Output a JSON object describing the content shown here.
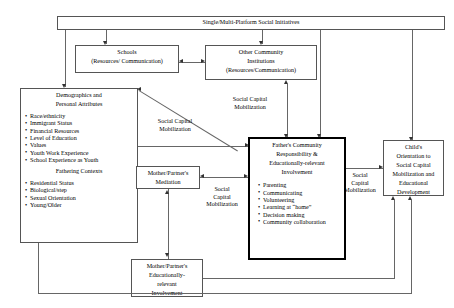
{
  "figure": {
    "type": "conceptual-flow-diagram",
    "title_box": {
      "label": "Single/Multi-Platform Social Initiatives"
    },
    "boxes": [
      {
        "id": "schools",
        "lines": [
          "Schools",
          "(Resources/ Communication)"
        ]
      },
      {
        "id": "other_community",
        "lines": [
          "Other Community",
          "Institutions",
          "(Resources/Communication)"
        ]
      },
      {
        "id": "demographics",
        "heading": [
          "Demographics and",
          "Personal Attributes"
        ],
        "items": [
          "Race/ethnicity",
          "Immigrant Status",
          "Financial Resources",
          "Level of Education",
          "Values",
          "Youth Work Experience",
          "School Experience as Youth"
        ],
        "subheading": "Fathering Contexts",
        "subitems": [
          "Residential Status",
          "Biological/step",
          "Sexual Orientation",
          "Young/Older"
        ]
      },
      {
        "id": "mother_mediation",
        "lines": [
          "Mother/Partner's",
          "Mediation"
        ]
      },
      {
        "id": "mother_involvement",
        "lines": [
          "Mother/Partner's",
          "Educationally-",
          "relevant",
          "Involvement"
        ]
      },
      {
        "id": "father_center",
        "heading": [
          "Father's  Community",
          "Responsibility &",
          "Educationally-relevant",
          "Involvement"
        ],
        "items": [
          "Parenting",
          "Communicating",
          "Volunteering",
          "Learning at “home”",
          "Decision making",
          "Community collaboration"
        ]
      },
      {
        "id": "child_outcome",
        "lines": [
          "Child's",
          "Orientation to",
          "Social Capital",
          "Mobilization and",
          "Educational",
          "Development"
        ]
      }
    ],
    "edge_labels": [
      {
        "id": "scm_left",
        "lines": [
          "Social Capital",
          "Mobilization"
        ]
      },
      {
        "id": "scm_top",
        "lines": [
          "Social Capital",
          "Mobilization"
        ]
      },
      {
        "id": "scm_mid",
        "lines": [
          "Social",
          "Capital",
          "Mobilization"
        ]
      },
      {
        "id": "scm_right",
        "lines": [
          "Social",
          "Capital",
          "Mobilization"
        ]
      }
    ],
    "colors": {
      "line": "#666666",
      "arrow": "#333333",
      "emphasis_border": "#000000",
      "background": "#ffffff"
    }
  }
}
